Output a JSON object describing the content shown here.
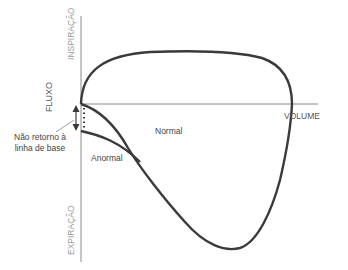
{
  "diagram": {
    "axes": {
      "y_label": "FLUXO",
      "y_top_label": "INSPIRAÇÃO",
      "y_bottom_label": "EXPIRAÇÃO",
      "x_label": "VOLUME"
    },
    "curves": {
      "normal_label": "Normal",
      "abnormal_label": "Anormal"
    },
    "annotation": {
      "line1": "Não retorno à",
      "line2": "linha de base"
    },
    "colors": {
      "curve": "#3a3a3a",
      "axis": "#888888",
      "text": "#444444",
      "axis_text": "#999999"
    }
  }
}
